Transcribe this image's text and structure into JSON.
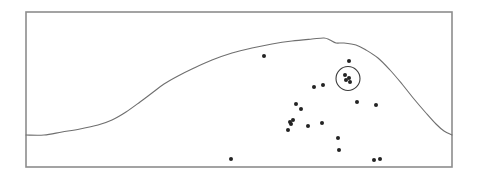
{
  "figure": {
    "background_color": "#ffffff",
    "frame_color": "#8d8d8d",
    "curve_color": "#6f6f6f",
    "point_color": "#232323",
    "circle_color": "#3b3b3b"
  },
  "chart_data": {
    "type": "scatter",
    "title": "",
    "subtitle": "",
    "xlabel": "",
    "ylabel": "",
    "xlim": [
      26,
      452
    ],
    "ylim": [
      167,
      12
    ],
    "grid": false,
    "legend": null,
    "axis_ticks": {
      "x": [],
      "y": []
    },
    "frame": {
      "x": 26,
      "y": 12,
      "width": 426,
      "height": 155
    },
    "series": [
      {
        "name": "points",
        "marker": "dot",
        "marker_size": 2.0,
        "color": "#232323",
        "points": [
          {
            "x": 264,
            "y": 56
          },
          {
            "x": 349,
            "y": 61
          },
          {
            "x": 345,
            "y": 75
          },
          {
            "x": 349,
            "y": 78
          },
          {
            "x": 346,
            "y": 80
          },
          {
            "x": 350,
            "y": 82
          },
          {
            "x": 314,
            "y": 87
          },
          {
            "x": 323,
            "y": 85
          },
          {
            "x": 357,
            "y": 102
          },
          {
            "x": 376,
            "y": 105
          },
          {
            "x": 296,
            "y": 104
          },
          {
            "x": 301,
            "y": 109
          },
          {
            "x": 290,
            "y": 122
          },
          {
            "x": 293,
            "y": 120
          },
          {
            "x": 291,
            "y": 124
          },
          {
            "x": 288,
            "y": 130
          },
          {
            "x": 308,
            "y": 126
          },
          {
            "x": 322,
            "y": 123
          },
          {
            "x": 338,
            "y": 138
          },
          {
            "x": 339,
            "y": 150
          },
          {
            "x": 231,
            "y": 159
          },
          {
            "x": 374,
            "y": 160
          },
          {
            "x": 380,
            "y": 159
          }
        ]
      }
    ],
    "annotations": [
      {
        "type": "circle",
        "label": "circled-cluster",
        "cx": 348,
        "cy": 78.5,
        "r": 12,
        "encloses": 4
      }
    ],
    "profile_curve": {
      "name": "terrain-profile",
      "color": "#6f6f6f",
      "points": [
        {
          "x": 26,
          "y": 135
        },
        {
          "x": 44,
          "y": 135
        },
        {
          "x": 62,
          "y": 132
        },
        {
          "x": 80,
          "y": 129
        },
        {
          "x": 98,
          "y": 125
        },
        {
          "x": 112,
          "y": 120
        },
        {
          "x": 126,
          "y": 112
        },
        {
          "x": 140,
          "y": 102
        },
        {
          "x": 152,
          "y": 93
        },
        {
          "x": 164,
          "y": 84
        },
        {
          "x": 178,
          "y": 76
        },
        {
          "x": 194,
          "y": 68
        },
        {
          "x": 212,
          "y": 60
        },
        {
          "x": 232,
          "y": 53
        },
        {
          "x": 252,
          "y": 48
        },
        {
          "x": 272,
          "y": 44
        },
        {
          "x": 292,
          "y": 41
        },
        {
          "x": 312,
          "y": 39
        },
        {
          "x": 324,
          "y": 38
        },
        {
          "x": 330,
          "y": 40
        },
        {
          "x": 336,
          "y": 43
        },
        {
          "x": 344,
          "y": 43
        },
        {
          "x": 356,
          "y": 45
        },
        {
          "x": 366,
          "y": 50
        },
        {
          "x": 378,
          "y": 58
        },
        {
          "x": 390,
          "y": 70
        },
        {
          "x": 402,
          "y": 84
        },
        {
          "x": 414,
          "y": 99
        },
        {
          "x": 426,
          "y": 113
        },
        {
          "x": 436,
          "y": 124
        },
        {
          "x": 444,
          "y": 131
        },
        {
          "x": 452,
          "y": 135
        }
      ]
    }
  }
}
